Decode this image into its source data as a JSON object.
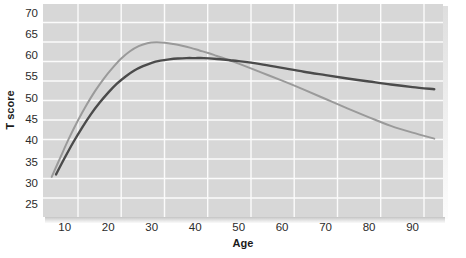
{
  "chart_data": {
    "type": "line",
    "title": "",
    "xlabel": "Age",
    "ylabel": "T score",
    "xlim": [
      5,
      97
    ],
    "ylim": [
      22,
      72
    ],
    "grid": true,
    "legend_position": "none",
    "xticks": [
      10,
      20,
      30,
      40,
      50,
      60,
      70,
      80,
      90
    ],
    "yticks": [
      25,
      30,
      35,
      40,
      45,
      50,
      55,
      60,
      65,
      70
    ],
    "xtick_labels": [
      "10",
      "20",
      "30",
      "40",
      "50",
      "60",
      "70",
      "80",
      "90"
    ],
    "ytick_labels": [
      "25",
      "30",
      "35",
      "40",
      "45",
      "50",
      "55",
      "60",
      "65",
      "70"
    ],
    "series": [
      {
        "name": "light-curve",
        "color": "#9a9a9a",
        "x": [
          7,
          9,
          11,
          13,
          15,
          17,
          19,
          21,
          23,
          25,
          27,
          29,
          31,
          33,
          35,
          37,
          39,
          41,
          43,
          45,
          47,
          50,
          55,
          60,
          65,
          70,
          75,
          80,
          85,
          90,
          95
        ],
        "y": [
          31.4,
          36.0,
          40.5,
          44.6,
          48.3,
          51.6,
          54.5,
          57.0,
          59.2,
          60.9,
          62.1,
          62.8,
          63.0,
          62.9,
          62.6,
          62.2,
          61.7,
          61.1,
          60.5,
          59.8,
          59.1,
          58.0,
          56.0,
          54.0,
          51.9,
          49.7,
          47.5,
          45.4,
          43.4,
          41.8,
          40.4
        ]
      },
      {
        "name": "dark-curve",
        "color": "#4b4b4b",
        "x": [
          8,
          10,
          12,
          14,
          16,
          18,
          20,
          22,
          24,
          26,
          28,
          30,
          32,
          34,
          36,
          38,
          40,
          42,
          45,
          48,
          50,
          55,
          60,
          65,
          70,
          75,
          80,
          85,
          90,
          95
        ],
        "y": [
          32.0,
          35.9,
          39.6,
          43.0,
          46.1,
          48.8,
          51.2,
          53.3,
          55.0,
          56.4,
          57.4,
          58.2,
          58.7,
          59.0,
          59.2,
          59.3,
          59.3,
          59.3,
          59.1,
          58.8,
          58.6,
          57.9,
          57.0,
          56.1,
          55.3,
          54.5,
          53.8,
          53.1,
          52.5,
          52.0
        ]
      }
    ],
    "colors": {
      "plot_background": "#d7d7d7",
      "grid_line": "#fbfbfb",
      "page_background": "#ffffff",
      "text": "#2b2b2b",
      "light_series": "#9a9a9a",
      "dark_series": "#4b4b4b"
    }
  }
}
